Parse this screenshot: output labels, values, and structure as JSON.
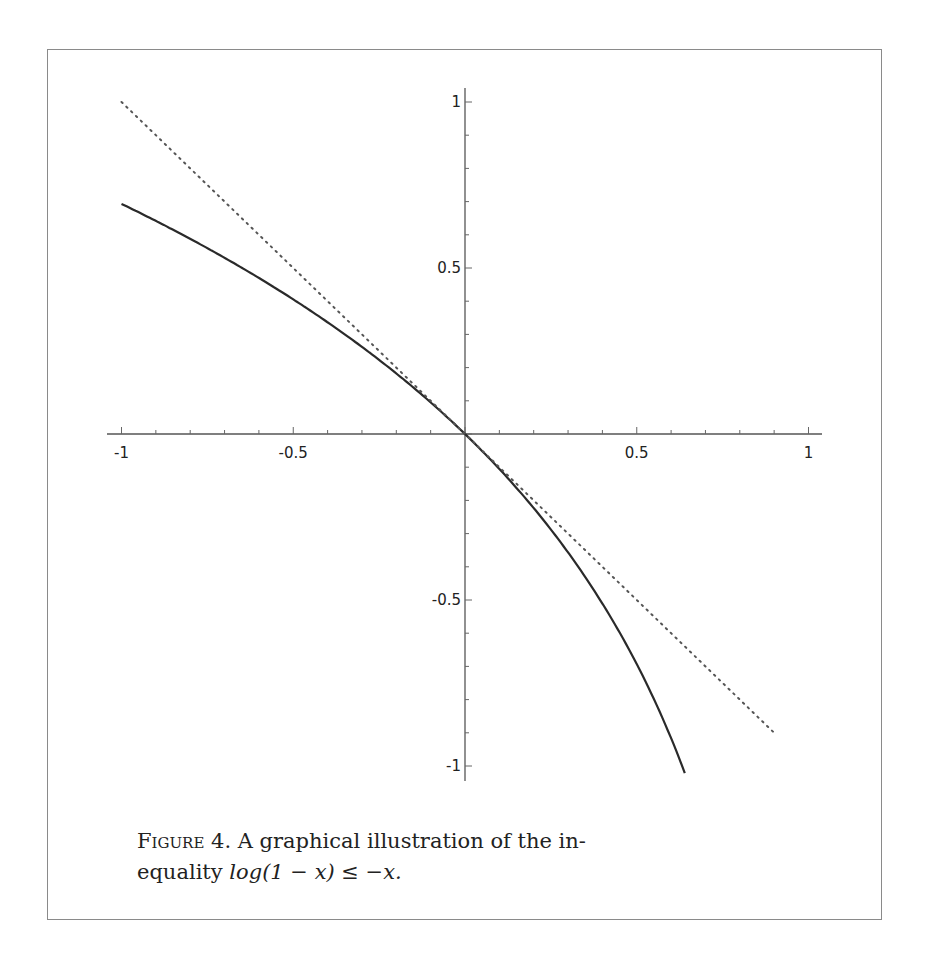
{
  "figure": {
    "label": "Figure 4.",
    "caption_text": "A graphical illustration of the in-",
    "caption_line2_prefix": "equality ",
    "caption_math": "log(1 − x) ≤ −x.",
    "caption_full": "FIGURE 4. A graphical illustration of the inequality log(1 − x) ≤ −x."
  },
  "chart_data": {
    "type": "line",
    "title": "",
    "xlabel": "",
    "ylabel": "",
    "xlim": [
      -1,
      1
    ],
    "ylim": [
      -1,
      1
    ],
    "x_ticks": [
      "-1",
      "-0.5",
      "0.5",
      "1"
    ],
    "y_ticks": [
      "1",
      "0.5",
      "-0.5",
      "-1"
    ],
    "grid": false,
    "legend": null,
    "series": [
      {
        "name": "log(1 - x)",
        "style": "solid",
        "x": [
          -1,
          -0.8,
          -0.6,
          -0.4,
          -0.2,
          0,
          0.2,
          0.4,
          0.5,
          0.6,
          0.64
        ],
        "y": [
          0.693,
          0.588,
          0.47,
          0.336,
          0.182,
          0,
          -0.223,
          -0.511,
          -0.693,
          -0.916,
          -1.022
        ]
      },
      {
        "name": "-x",
        "style": "dotted",
        "x": [
          -1,
          0.9
        ],
        "y": [
          1,
          -0.9
        ]
      }
    ]
  }
}
